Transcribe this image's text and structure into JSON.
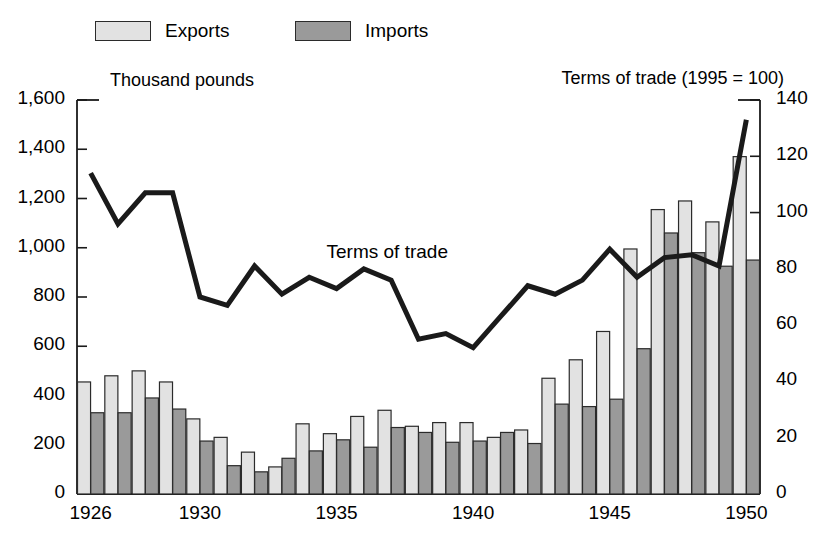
{
  "legend": {
    "entries": [
      {
        "label": "Exports",
        "color": "#e2e2e2",
        "swatch": "light"
      },
      {
        "label": "Imports",
        "color": "#9a9a9a",
        "swatch": "dark"
      }
    ]
  },
  "axes": {
    "left_title": "Thousand pounds",
    "right_title": "Terms of trade (1995 = 100)",
    "left_ticks": [
      "0",
      "200",
      "400",
      "600",
      "800",
      "1,000",
      "1,200",
      "1,400",
      "1,600"
    ],
    "right_ticks": [
      "0",
      "20",
      "40",
      "60",
      "80",
      "100",
      "120",
      "140"
    ],
    "x_ticks": [
      "1926",
      "1930",
      "1935",
      "1940",
      "1945",
      "1950"
    ]
  },
  "annotations": {
    "line_label": "Terms of trade"
  },
  "colors": {
    "exports": "#e2e2e2",
    "imports": "#9a9a9a",
    "bar_stroke": "#2b2b2b",
    "line": "#1a1a1a",
    "axis": "#1a1a1a"
  },
  "chart_data": {
    "type": "bar",
    "title": "",
    "subtitle": "",
    "xlabel": "",
    "ylabel": "Thousand pounds",
    "y2label": "Terms of trade (1995 = 100)",
    "ylim": [
      0,
      1600
    ],
    "y2lim": [
      0,
      140
    ],
    "ytick_step": 200,
    "y2tick_step": 20,
    "grid": false,
    "legend_position": "top",
    "categories": [
      "1926",
      "1927",
      "1928",
      "1929",
      "1930",
      "1931",
      "1932",
      "1933",
      "1934",
      "1935",
      "1936",
      "1937",
      "1938",
      "1939",
      "1940",
      "1941",
      "1942",
      "1943",
      "1944",
      "1945",
      "1946",
      "1947",
      "1948",
      "1949",
      "1950"
    ],
    "series": [
      {
        "name": "Exports",
        "type": "bar",
        "axis": "left",
        "unit": "Thousand pounds",
        "values": [
          455,
          480,
          500,
          455,
          305,
          230,
          170,
          110,
          285,
          245,
          315,
          340,
          275,
          290,
          290,
          230,
          260,
          470,
          545,
          660,
          995,
          1155,
          1190,
          1105,
          1370
        ]
      },
      {
        "name": "Imports",
        "type": "bar",
        "axis": "left",
        "unit": "Thousand pounds",
        "values": [
          330,
          330,
          390,
          345,
          215,
          115,
          90,
          145,
          175,
          220,
          190,
          270,
          250,
          210,
          215,
          250,
          205,
          365,
          355,
          385,
          590,
          1060,
          980,
          925,
          950
        ]
      },
      {
        "name": "Terms of trade",
        "type": "line",
        "axis": "right",
        "unit": "index (1995 = 100)",
        "values": [
          114,
          96,
          107,
          107,
          70,
          67,
          81,
          71,
          77,
          73,
          80,
          76,
          55,
          57,
          52,
          63,
          74,
          71,
          76,
          87,
          77,
          84,
          85,
          81,
          133
        ]
      }
    ]
  }
}
